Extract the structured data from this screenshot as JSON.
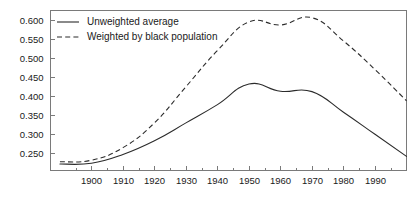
{
  "chart_data": {
    "type": "line",
    "title": "",
    "subtitle": "",
    "xlabel": "",
    "ylabel": "",
    "xlim": [
      1887,
      2000
    ],
    "ylim": [
      0.205,
      0.625
    ],
    "grid": false,
    "legend_position": "top-left",
    "x_ticks": [
      1900,
      1910,
      1920,
      1930,
      1940,
      1950,
      1960,
      1970,
      1980,
      1990
    ],
    "x_tick_labels": [
      "1900",
      "1910",
      "1920",
      "1930",
      "1940",
      "1950",
      "1960",
      "1970",
      "1980",
      "1990"
    ],
    "x_minor_ticks": [
      1895,
      1905,
      1915,
      1925,
      1935,
      1945,
      1955,
      1965,
      1975,
      1985,
      1995
    ],
    "y_ticks": [
      0.25,
      0.3,
      0.35,
      0.4,
      0.45,
      0.5,
      0.55,
      0.6
    ],
    "y_tick_labels": [
      "0.250",
      "0.300",
      "0.350",
      "0.400",
      "0.450",
      "0.500",
      "0.550",
      "0.600"
    ],
    "x": [
      1890,
      1900,
      1910,
      1920,
      1930,
      1940,
      1950,
      1960,
      1970,
      1980,
      1990,
      2000
    ],
    "series": [
      {
        "name": "Unweighted average",
        "style": "solid",
        "color": "#2b2b2b",
        "values": [
          0.222,
          0.224,
          0.247,
          0.283,
          0.33,
          0.378,
          0.432,
          0.413,
          0.412,
          0.358,
          0.3,
          0.242
        ]
      },
      {
        "name": "Weighted by black population",
        "style": "dashed",
        "color": "#2b2b2b",
        "values": [
          0.228,
          0.232,
          0.265,
          0.33,
          0.425,
          0.52,
          0.595,
          0.587,
          0.606,
          0.545,
          0.47,
          0.388
        ]
      }
    ]
  },
  "legend": {
    "items": [
      {
        "label": "Unweighted average",
        "style": "solid"
      },
      {
        "label": "Weighted by black population",
        "style": "dashed"
      }
    ]
  },
  "axes": {
    "y_labels": [
      "0.600",
      "0.550",
      "0.500",
      "0.450",
      "0.400",
      "0.350",
      "0.300",
      "0.250"
    ],
    "x_labels": [
      "1900",
      "1910",
      "1920",
      "1930",
      "1940",
      "1950",
      "1960",
      "1970",
      "1980",
      "1990"
    ]
  },
  "colors": {
    "line": "#2b2b2b",
    "axis": "#7a7a7a",
    "text": "#1a1a1a",
    "background": "#ffffff"
  }
}
